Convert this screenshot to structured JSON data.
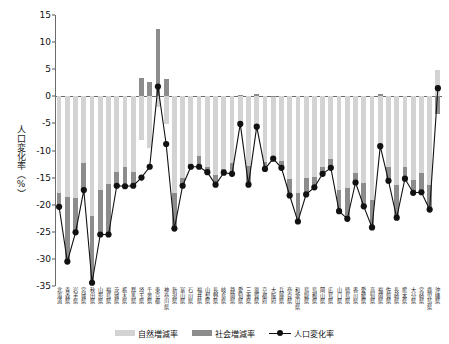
{
  "chart_data": {
    "type": "bar",
    "title": "",
    "xlabel": "",
    "ylabel": "人口変化率（%）",
    "ylim": [
      -35,
      15
    ],
    "yticks": [
      15,
      10,
      5,
      0,
      -5,
      -10,
      -15,
      -20,
      -25,
      -30,
      -35
    ],
    "grid": false,
    "legend_position": "bottom",
    "stacked": true,
    "categories": [
      "北海道",
      "青森県",
      "岩手県",
      "宮城県",
      "秋田県",
      "山形県",
      "福島県",
      "茨城県",
      "栃木県",
      "群馬県",
      "埼玉県",
      "千葉県",
      "東京都",
      "神奈川県",
      "新潟県",
      "富山県",
      "石川県",
      "福井県",
      "山梨県",
      "長野県",
      "岐阜県",
      "静岡県",
      "愛知県",
      "三重県",
      "滋賀県",
      "京都府",
      "大阪府",
      "兵庫県",
      "奈良県",
      "和歌山県",
      "鳥取県",
      "島根県",
      "岡山県",
      "広島県",
      "山口県",
      "徳島県",
      "香川県",
      "愛媛県",
      "高知県",
      "福岡県",
      "佐賀県",
      "長崎県",
      "熊本県",
      "大分県",
      "宮崎県",
      "鹿児島県",
      "沖縄県"
    ],
    "series": [
      {
        "name": "自然増減率",
        "color": "#d3d3d3",
        "values": [
          -17.8,
          -18.5,
          -18.8,
          -12.3,
          -22.0,
          -17.3,
          -16.2,
          -13.9,
          -13.0,
          -14.0,
          -8.0,
          -9.5,
          -2.0,
          -5.2,
          -17.8,
          -15.0,
          -12.4,
          -11.0,
          -13.0,
          -14.5,
          -13.5,
          -12.3,
          -5.3,
          -12.8,
          -6.0,
          -12.2,
          -11.6,
          -12.0,
          -15.2,
          -17.8,
          -15.1,
          -14.8,
          -13.0,
          -11.6,
          -17.2,
          -17.0,
          -14.1,
          -16.0,
          -19.2,
          -9.7,
          -13.0,
          -16.4,
          -13.0,
          -15.4,
          -14.2,
          -16.4,
          4.8
        ]
      },
      {
        "name": "社会増減率",
        "color": "#8c8c8c",
        "values": [
          -2.6,
          -12.0,
          -6.3,
          -5.0,
          -12.4,
          -8.2,
          -9.3,
          -2.6,
          -3.6,
          -2.5,
          3.3,
          2.6,
          12.5,
          3.2,
          -6.6,
          -1.5,
          -0.6,
          -2.0,
          -1.0,
          -1.8,
          -0.6,
          -2.0,
          0.2,
          -3.5,
          0.4,
          -1.2,
          0.1,
          -1.2,
          -3.1,
          -5.3,
          -3.0,
          -2.0,
          -1.3,
          -1.6,
          -4.0,
          -5.6,
          -1.8,
          -4.3,
          -5.0,
          0.5,
          -2.6,
          -6.0,
          -2.2,
          -2.4,
          -3.5,
          -4.5,
          -3.3
        ]
      }
    ],
    "line_series": {
      "name": "人口変化率",
      "color": "#111111",
      "marker": "circle",
      "values": [
        -20.4,
        -30.5,
        -25.1,
        -17.3,
        -34.4,
        -25.5,
        -25.5,
        -16.5,
        -16.6,
        -16.5,
        -15.0,
        -13.0,
        1.8,
        -8.8,
        -24.4,
        -16.5,
        -13.0,
        -13.0,
        -14.0,
        -16.3,
        -14.1,
        -14.3,
        -5.1,
        -16.3,
        -5.6,
        -13.4,
        -11.5,
        -13.2,
        -18.3,
        -23.1,
        -18.1,
        -16.8,
        -14.3,
        -13.2,
        -21.2,
        -22.6,
        -15.9,
        -20.3,
        -24.2,
        -9.2,
        -15.6,
        -22.4,
        -15.2,
        -17.8,
        -17.7,
        -20.9,
        1.5
      ]
    }
  },
  "legend": {
    "natural_label": "自然増減率",
    "social_label": "社会増減率",
    "line_label": "人口変化率"
  }
}
